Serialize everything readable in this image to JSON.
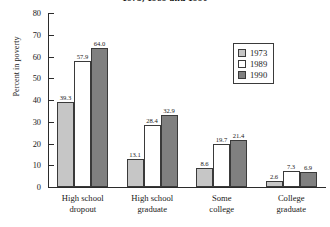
{
  "chart_data": {
    "type": "bar",
    "title": "1973, 1989 and 1990",
    "xlabel": "",
    "ylabel": "Percent in poverty",
    "ylim": [
      0,
      80
    ],
    "yticks": [
      0,
      10,
      20,
      30,
      40,
      50,
      60,
      70,
      80
    ],
    "grid": false,
    "legend_position": "upper-right",
    "categories": [
      "High school dropout",
      "High school graduate",
      "Some college",
      "College graduate"
    ],
    "category_lines": [
      [
        "High school",
        "dropout"
      ],
      [
        "High school",
        "graduate"
      ],
      [
        "Some",
        "college"
      ],
      [
        "College",
        "graduate"
      ]
    ],
    "series": [
      {
        "name": "1973",
        "color": "#c6c6c6",
        "values": [
          39.3,
          13.1,
          8.6,
          2.6
        ]
      },
      {
        "name": "1989",
        "color": "#ffffff",
        "values": [
          57.9,
          28.4,
          19.7,
          7.3
        ]
      },
      {
        "name": "1990",
        "color": "#808080",
        "values": [
          64.0,
          32.9,
          21.4,
          6.9
        ]
      }
    ],
    "value_labels": [
      [
        "39.3",
        "57.9",
        "64.0"
      ],
      [
        "13.1",
        "28.4",
        "32.9"
      ],
      [
        "8.6",
        "19.7",
        "21.4"
      ],
      [
        "2.6",
        "7.3",
        "6.9"
      ]
    ]
  },
  "legend": {
    "items": [
      {
        "label": "1973"
      },
      {
        "label": "1989"
      },
      {
        "label": "1990"
      }
    ]
  }
}
